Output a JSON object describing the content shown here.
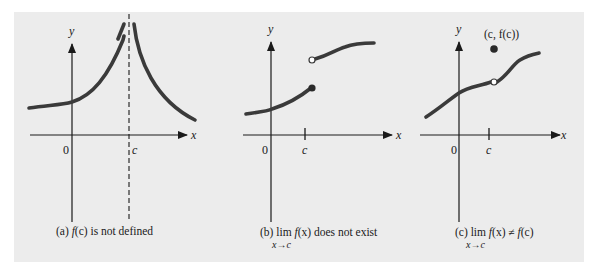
{
  "figure": {
    "background": "#ececec",
    "curve_color": "#3a3a3a",
    "axis_color": "#1a1a1a",
    "panels": [
      {
        "id": "a",
        "axis_labels": {
          "x": "x",
          "y": "y"
        },
        "tick_labels": {
          "origin": "0",
          "c": "c"
        },
        "caption": {
          "prefix": "(a) ",
          "func": "f",
          "arg": "(c)",
          "rest": " is not defined"
        },
        "features": [
          "vertical asymptote at x = c (dashed line)"
        ]
      },
      {
        "id": "b",
        "axis_labels": {
          "x": "x",
          "y": "y"
        },
        "tick_labels": {
          "origin": "0",
          "c": "c"
        },
        "caption": {
          "prefix": "(b) lim ",
          "func": "f",
          "arg": "(x)",
          "rest": " does not exist",
          "subscript": "x→c"
        },
        "features": [
          "jump discontinuity: filled dot on lower branch, open dot on upper branch"
        ]
      },
      {
        "id": "c",
        "axis_labels": {
          "x": "x",
          "y": "y"
        },
        "tick_labels": {
          "origin": "0",
          "c": "c"
        },
        "point_label": "(c, f(c))",
        "caption": {
          "prefix": "(c) lim ",
          "func": "f",
          "arg": "(x)",
          "neq": " ≠ ",
          "func2": "f",
          "arg2": "(c)",
          "subscript": "x→c"
        },
        "features": [
          "removable discontinuity: open dot on curve, filled dot above at (c, f(c))"
        ]
      }
    ]
  }
}
